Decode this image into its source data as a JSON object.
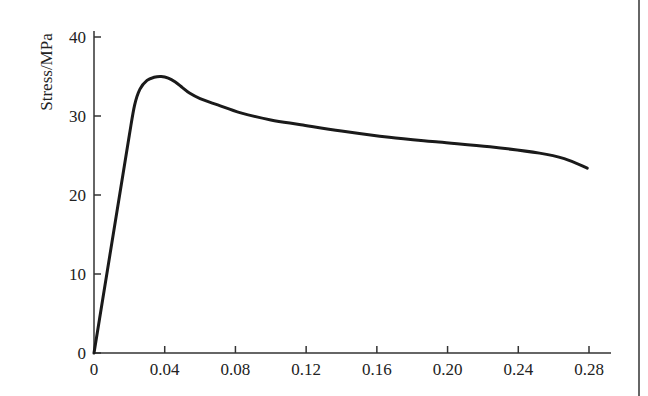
{
  "chart_data": {
    "type": "line",
    "title": "",
    "xlabel": "",
    "ylabel": "Stress/MPa",
    "xlim": [
      0,
      0.28
    ],
    "ylim": [
      0,
      40
    ],
    "grid": false,
    "legend": null,
    "x_ticks": [
      "0",
      "0.04",
      "0.08",
      "0.12",
      "0.16",
      "0.20",
      "0.24",
      "0.28"
    ],
    "x_tick_values": [
      0,
      0.04,
      0.08,
      0.12,
      0.16,
      0.2,
      0.24,
      0.28
    ],
    "y_ticks": [
      "0",
      "10",
      "20",
      "30",
      "40"
    ],
    "y_tick_values": [
      0,
      10,
      20,
      30,
      40
    ],
    "series": [
      {
        "name": "stress-strain curve",
        "x": [
          0,
          0.005,
          0.01,
          0.015,
          0.02,
          0.023,
          0.026,
          0.03,
          0.034,
          0.038,
          0.042,
          0.046,
          0.05,
          0.054,
          0.06,
          0.07,
          0.083,
          0.1,
          0.117,
          0.14,
          0.167,
          0.195,
          0.224,
          0.252,
          0.266,
          0.279
        ],
        "y": [
          0,
          6.9,
          13.8,
          20.7,
          27.6,
          31.4,
          33.4,
          34.5,
          34.9,
          35.0,
          34.8,
          34.3,
          33.6,
          32.9,
          32.2,
          31.4,
          30.4,
          29.5,
          28.9,
          28.1,
          27.3,
          26.7,
          26.1,
          25.3,
          24.6,
          23.4
        ]
      }
    ]
  }
}
